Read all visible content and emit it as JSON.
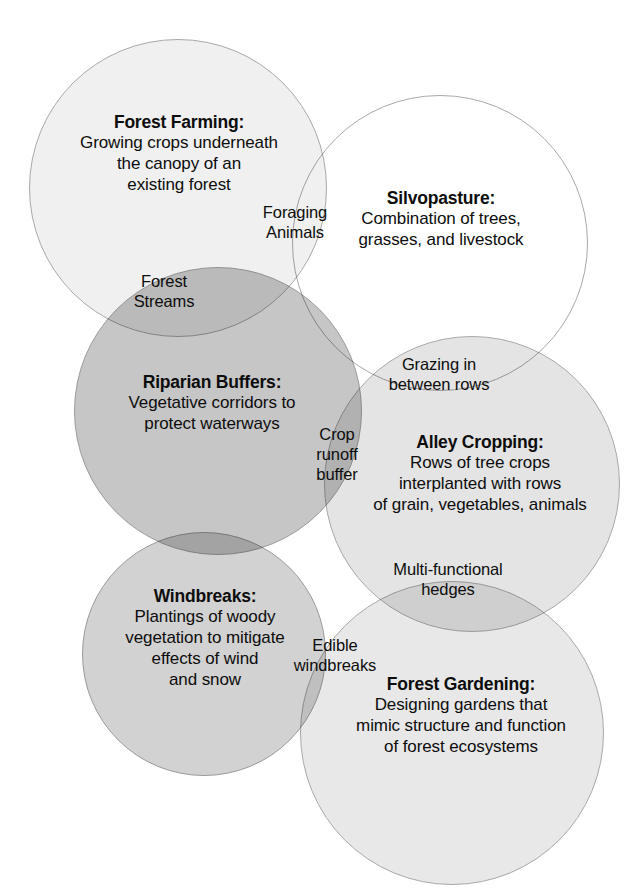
{
  "diagram": {
    "background_color": "#ffffff",
    "text_color": "#0d0d0d"
  },
  "circles": [
    {
      "key": "forest_farming",
      "name": "Forest Farming",
      "title": "Forest Farming:",
      "description": "Growing crops underneath the canopy of an existing forest",
      "fill": "#f0f0f0",
      "stroke": "#a8a8a8",
      "cx": 178,
      "cy": 188,
      "r": 149
    },
    {
      "key": "silvopasture",
      "name": "Silvopasture",
      "title": "Silvopasture:",
      "description": "Combination of trees, grasses, and livestock",
      "fill": "#ffffff",
      "stroke": "#a8a8a8",
      "cx": 440,
      "cy": 243,
      "r": 148
    },
    {
      "key": "riparian_buffers",
      "name": "Riparian Buffers",
      "title": "Riparian Buffers:",
      "description": "Vegetative corridors to protect waterways",
      "fill": "#c6c6c6",
      "stroke": "#9a9a9a",
      "cx": 218,
      "cy": 411,
      "r": 144
    },
    {
      "key": "alley_cropping",
      "name": "Alley Cropping",
      "title": "Alley Cropping:",
      "description": "Rows of tree crops interplanted with rows of grain, vegetables, animals",
      "fill": "#e4e4e4",
      "stroke": "#a8a8a8",
      "cx": 472,
      "cy": 484,
      "r": 148
    },
    {
      "key": "windbreaks",
      "name": "Windbreaks",
      "title": "Windbreaks:",
      "description": "Plantings of woody vegetation to mitigate effects of wind and snow",
      "fill": "#d2d2d2",
      "stroke": "#9a9a9a",
      "cx": 204,
      "cy": 654,
      "r": 122
    },
    {
      "key": "forest_gardening",
      "name": "Forest Gardening",
      "title": "Forest Gardening:",
      "description": "Designing gardens that mimic structure and function of forest ecosystems",
      "fill": "#e8e8e8",
      "stroke": "#a8a8a8",
      "cx": 452,
      "cy": 733,
      "r": 152
    }
  ],
  "overlaps": [
    {
      "key": "foraging_animals",
      "label": "Foraging Animals",
      "between": [
        "Forest Farming",
        "Silvopasture"
      ]
    },
    {
      "key": "forest_streams",
      "label": "Forest Streams",
      "between": [
        "Forest Farming",
        "Riparian Buffers"
      ]
    },
    {
      "key": "grazing_in_between_rows",
      "label": "Grazing in between rows",
      "between": [
        "Silvopasture",
        "Alley Cropping"
      ]
    },
    {
      "key": "crop_runoff_buffer",
      "label": "Crop runoff buffer",
      "between": [
        "Riparian Buffers",
        "Alley Cropping"
      ]
    },
    {
      "key": "multi_functional_hedges",
      "label": "Multi-functional hedges",
      "between": [
        "Alley Cropping",
        "Forest Gardening"
      ]
    },
    {
      "key": "edible_windbreaks",
      "label": "Edible windbreaks",
      "between": [
        "Windbreaks",
        "Forest Gardening"
      ]
    }
  ],
  "chart_data": {
    "type": "venn",
    "sets": [
      {
        "name": "Forest Farming",
        "description": "Growing crops underneath the canopy of an existing forest"
      },
      {
        "name": "Silvopasture",
        "description": "Combination of trees, grasses, and livestock"
      },
      {
        "name": "Riparian Buffers",
        "description": "Vegetative corridors to protect waterways"
      },
      {
        "name": "Alley Cropping",
        "description": "Rows of tree crops interplanted with rows of grain, vegetables, animals"
      },
      {
        "name": "Windbreaks",
        "description": "Plantings of woody vegetation to mitigate effects of wind and snow"
      },
      {
        "name": "Forest Gardening",
        "description": "Designing gardens that mimic structure and function of forest ecosystems"
      }
    ],
    "intersections": [
      {
        "sets": [
          "Forest Farming",
          "Silvopasture"
        ],
        "label": "Foraging Animals"
      },
      {
        "sets": [
          "Forest Farming",
          "Riparian Buffers"
        ],
        "label": "Forest Streams"
      },
      {
        "sets": [
          "Silvopasture",
          "Alley Cropping"
        ],
        "label": "Grazing in between rows"
      },
      {
        "sets": [
          "Riparian Buffers",
          "Alley Cropping"
        ],
        "label": "Crop runoff buffer"
      },
      {
        "sets": [
          "Alley Cropping",
          "Forest Gardening"
        ],
        "label": "Multi-functional hedges"
      },
      {
        "sets": [
          "Windbreaks",
          "Forest Gardening"
        ],
        "label": "Edible windbreaks"
      }
    ],
    "legend": "none",
    "grid": false
  },
  "labels": {
    "forest_farming": {
      "title": "Forest Farming:",
      "line1": "Growing crops underneath",
      "line2": "the canopy of an",
      "line3": "existing forest"
    },
    "silvopasture": {
      "title": "Silvopasture:",
      "line1": "Combination of trees,",
      "line2": "grasses, and livestock"
    },
    "riparian_buffers": {
      "title": "Riparian Buffers:",
      "line1": "Vegetative corridors to",
      "line2": "protect waterways"
    },
    "alley_cropping": {
      "title": "Alley Cropping:",
      "line1": "Rows of tree crops",
      "line2": "interplanted with rows",
      "line3": "of grain, vegetables, animals"
    },
    "windbreaks": {
      "title": "Windbreaks:",
      "line1": "Plantings of woody",
      "line2": "vegetation to mitigate",
      "line3": "effects of wind",
      "line4": "and snow"
    },
    "forest_gardening": {
      "title": "Forest Gardening:",
      "line1": "Designing gardens that",
      "line2": "mimic structure and function",
      "line3": "of forest ecosystems"
    },
    "foraging_animals": {
      "line1": "Foraging",
      "line2": "Animals"
    },
    "forest_streams": {
      "line1": "Forest",
      "line2": "Streams"
    },
    "grazing_rows": {
      "line1": "Grazing in",
      "line2": "between rows"
    },
    "crop_runoff": {
      "line1": "Crop",
      "line2": "runoff",
      "line3": "buffer"
    },
    "multi_hedges": {
      "line1": "Multi-functional",
      "line2": "hedges"
    },
    "edible_windbreaks": {
      "line1": "Edible",
      "line2": "windbreaks"
    }
  }
}
